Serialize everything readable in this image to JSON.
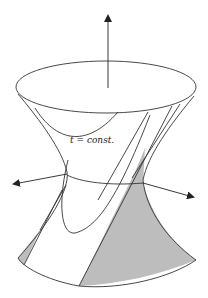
{
  "figure": {
    "label": "t = const.",
    "colors": {
      "stroke": "#333333",
      "shade": "#bdbdbd",
      "background": "#ffffff"
    },
    "axes": [
      {
        "name": "vertical-axis",
        "direction": "up"
      },
      {
        "name": "left-axis",
        "direction": "left"
      },
      {
        "name": "right-axis",
        "direction": "right"
      }
    ]
  }
}
